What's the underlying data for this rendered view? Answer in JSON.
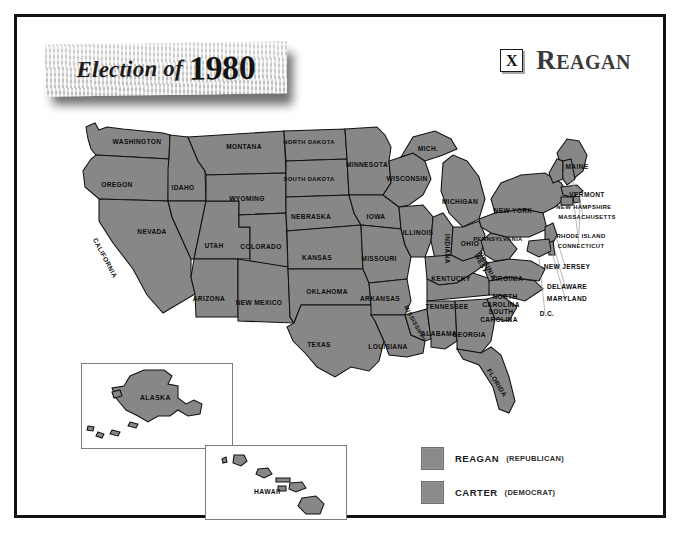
{
  "poster": {
    "title_italic": "Election of",
    "title_year": "1980",
    "winner": {
      "mark": "X",
      "name_first": "R",
      "name_rest": "EAGAN",
      "name_full": "REAGAN"
    }
  },
  "legend": {
    "items": [
      {
        "name": "REAGAN",
        "party": "(REPUBLICAN)",
        "color": "#8a8a8a"
      },
      {
        "name": "CARTER",
        "party": "(DEMOCRAT)",
        "color": "#8a8a8a"
      }
    ]
  },
  "insets": [
    {
      "label": "ALASKA"
    },
    {
      "label": "HAWAII"
    }
  ],
  "map": {
    "labels": [
      {
        "text": "WASHINGTON",
        "x": 98,
        "y": 35,
        "rot": 0
      },
      {
        "text": "OREGON",
        "x": 78,
        "y": 78,
        "rot": 0
      },
      {
        "text": "CALIFORNIA",
        "x": 64,
        "y": 150,
        "rot": 62
      },
      {
        "text": "IDAHO",
        "x": 144,
        "y": 81,
        "rot": 0
      },
      {
        "text": "NEVADA",
        "x": 113,
        "y": 125,
        "rot": 0
      },
      {
        "text": "UTAH",
        "x": 175,
        "y": 139,
        "rot": 0
      },
      {
        "text": "ARIZONA",
        "x": 170,
        "y": 192,
        "rot": 0
      },
      {
        "text": "MONTANA",
        "x": 205,
        "y": 40,
        "rot": 0
      },
      {
        "text": "WYOMING",
        "x": 208,
        "y": 92,
        "rot": 0
      },
      {
        "text": "COLORADO",
        "x": 222,
        "y": 140,
        "rot": 0
      },
      {
        "text": "NEW MEXICO",
        "x": 220,
        "y": 196,
        "rot": 0
      },
      {
        "text": "NORTH DAKOTA",
        "x": 270,
        "y": 35,
        "rot": 0
      },
      {
        "text": "SOUTH DAKOTA",
        "x": 270,
        "y": 72,
        "rot": 0
      },
      {
        "text": "NEBRASKA",
        "x": 272,
        "y": 110,
        "rot": 0
      },
      {
        "text": "KANSAS",
        "x": 278,
        "y": 151,
        "rot": 0
      },
      {
        "text": "OKLAHOMA",
        "x": 288,
        "y": 185,
        "rot": 0
      },
      {
        "text": "TEXAS",
        "x": 280,
        "y": 238,
        "rot": 0
      },
      {
        "text": "MINNESOTA",
        "x": 328,
        "y": 58,
        "rot": 0
      },
      {
        "text": "IOWA",
        "x": 337,
        "y": 110,
        "rot": 0
      },
      {
        "text": "MISSOURI",
        "x": 340,
        "y": 152,
        "rot": 0
      },
      {
        "text": "ARKANSAS",
        "x": 341,
        "y": 192,
        "rot": 0
      },
      {
        "text": "LOUISIANA",
        "x": 349,
        "y": 240,
        "rot": 0
      },
      {
        "text": "MISSISSIPPI",
        "x": 374,
        "y": 215,
        "rot": 62
      },
      {
        "text": "WISCONSIN",
        "x": 368,
        "y": 72,
        "rot": 0
      },
      {
        "text": "ILLINOIS",
        "x": 379,
        "y": 126,
        "rot": 0
      },
      {
        "text": "MICH.",
        "x": 389,
        "y": 42,
        "rot": 0
      },
      {
        "text": "MICHIGAN",
        "x": 421,
        "y": 95,
        "rot": 0
      },
      {
        "text": "INDIANA",
        "x": 406,
        "y": 140,
        "rot": 90
      },
      {
        "text": "OHIO",
        "x": 431,
        "y": 137,
        "rot": 0
      },
      {
        "text": "KENTUCKY",
        "x": 412,
        "y": 172,
        "rot": 0
      },
      {
        "text": "TENNESSEE",
        "x": 408,
        "y": 200,
        "rot": 0
      },
      {
        "text": "ALABAMA",
        "x": 400,
        "y": 227,
        "rot": 0
      },
      {
        "text": "GEORGIA",
        "x": 430,
        "y": 228,
        "rot": 0
      },
      {
        "text": "FLORIDA",
        "x": 456,
        "y": 275,
        "rot": 58
      },
      {
        "text": "SOUTH",
        "x": 462,
        "y": 205,
        "rot": 0
      },
      {
        "text": "CAROLINA",
        "x": 460,
        "y": 213,
        "rot": 0
      },
      {
        "text": "NORTH",
        "x": 466,
        "y": 190,
        "rot": 0
      },
      {
        "text": "CAROLINA",
        "x": 462,
        "y": 198,
        "rot": 0
      },
      {
        "text": "VIRGINIA",
        "x": 468,
        "y": 172,
        "rot": 0
      },
      {
        "text": "WEST",
        "x": 440,
        "y": 155,
        "rot": 62
      },
      {
        "text": "VIRGINIA",
        "x": 446,
        "y": 157,
        "rot": 62
      },
      {
        "text": "PENNSYLVANIA",
        "x": 459,
        "y": 132,
        "rot": 0
      },
      {
        "text": "NEW YORK",
        "x": 474,
        "y": 104,
        "rot": 0
      },
      {
        "text": "MAINE",
        "x": 538,
        "y": 60,
        "rot": 0
      },
      {
        "text": "VERMONT",
        "x": 548,
        "y": 88,
        "rot": 0
      },
      {
        "text": "NEW HAMPSHIRE",
        "x": 545,
        "y": 100,
        "rot": 0
      },
      {
        "text": "MASSACHUSETTS",
        "x": 548,
        "y": 110,
        "rot": 0
      },
      {
        "text": "RHODE ISLAND",
        "x": 542,
        "y": 129,
        "rot": 0
      },
      {
        "text": "CONNECTICUT",
        "x": 542,
        "y": 139,
        "rot": 0
      },
      {
        "text": "NEW JERSEY",
        "x": 528,
        "y": 160,
        "rot": 0
      },
      {
        "text": "DELAWARE",
        "x": 528,
        "y": 180,
        "rot": 0
      },
      {
        "text": "MARYLAND",
        "x": 528,
        "y": 192,
        "rot": 0
      },
      {
        "text": "D.C.",
        "x": 508,
        "y": 207,
        "rot": 0
      }
    ]
  }
}
